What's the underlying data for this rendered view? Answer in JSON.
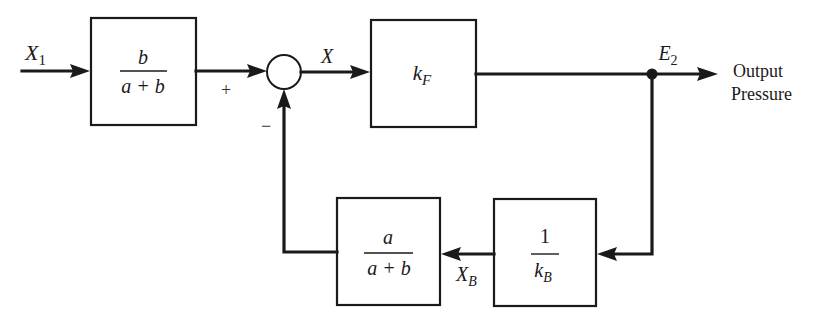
{
  "diagram": {
    "type": "feedback block diagram",
    "input": {
      "symbol": "X",
      "subscript": "1"
    },
    "blocks": [
      {
        "id": "forward-gain",
        "numerator": "b",
        "denominator": "a + b"
      },
      {
        "id": "plant",
        "symbol": "k",
        "subscript": "F"
      },
      {
        "id": "feedback-ratio",
        "numerator": "a",
        "denominator": "a + b"
      },
      {
        "id": "feedback-gain",
        "numerator": "1",
        "denominator_symbol": "k",
        "denominator_subscript": "B"
      }
    ],
    "summing_junction": {
      "plus_sign": "+",
      "minus_sign": "−"
    },
    "signals": {
      "error": {
        "symbol": "X"
      },
      "output": {
        "symbol": "E",
        "subscript": "2"
      },
      "feedback": {
        "symbol": "X",
        "subscript": "B"
      }
    },
    "output_label": {
      "line1": "Output",
      "line2": "Pressure"
    }
  }
}
